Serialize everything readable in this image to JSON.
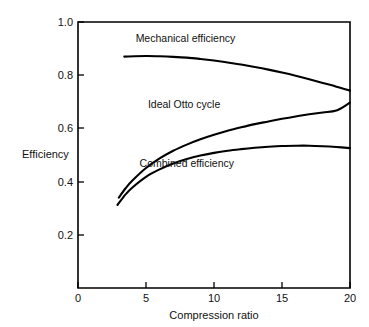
{
  "chart_data": {
    "type": "line",
    "title": "",
    "xlabel": "Compression ratio",
    "ylabel": "Efficiency",
    "xlim": [
      0,
      20
    ],
    "ylim": [
      0,
      1.0
    ],
    "grid": false,
    "legend_position": "inline-labels",
    "xticks": [
      0,
      5,
      10,
      15,
      20
    ],
    "xtick_labels": [
      "0",
      "5",
      "10",
      "15",
      "20"
    ],
    "yticks": [
      0.2,
      0.4,
      0.6,
      0.8,
      1.0
    ],
    "ytick_labels": [
      "0.2",
      "0.4",
      "0.6",
      "0.8",
      "1.0"
    ],
    "series": [
      {
        "name": "Mechanical efficiency",
        "color": "#000000",
        "x": [
          3.4,
          5,
          6,
          7,
          8,
          9,
          10,
          11,
          12,
          13,
          14,
          15,
          16,
          17,
          18,
          19,
          20
        ],
        "values": [
          0.87,
          0.872,
          0.871,
          0.869,
          0.866,
          0.861,
          0.855,
          0.848,
          0.84,
          0.831,
          0.821,
          0.81,
          0.798,
          0.785,
          0.771,
          0.757,
          0.742
        ]
      },
      {
        "name": "Ideal Otto cycle",
        "color": "#000000",
        "x": [
          3.0,
          3.5,
          4,
          5,
          6,
          7,
          8,
          9,
          10,
          11,
          12,
          13,
          14,
          15,
          16,
          17,
          18,
          19,
          20
        ],
        "values": [
          0.34,
          0.375,
          0.404,
          0.451,
          0.487,
          0.516,
          0.539,
          0.559,
          0.576,
          0.591,
          0.604,
          0.616,
          0.626,
          0.636,
          0.645,
          0.653,
          0.66,
          0.667,
          0.697
        ]
      },
      {
        "name": "Combined efficiency",
        "color": "#000000",
        "x": [
          2.9,
          3.5,
          4,
          5,
          6,
          7,
          8,
          9,
          10,
          11,
          12,
          13,
          14,
          15,
          16,
          17,
          18,
          19,
          20
        ],
        "values": [
          0.312,
          0.352,
          0.378,
          0.418,
          0.446,
          0.468,
          0.485,
          0.498,
          0.508,
          0.516,
          0.522,
          0.527,
          0.531,
          0.534,
          0.535,
          0.535,
          0.533,
          0.53,
          0.526
        ]
      }
    ],
    "annotations": [
      {
        "text": "Mechanical efficiency",
        "x": 7.9,
        "y": 0.925
      },
      {
        "text": "Ideal Otto cycle",
        "x": 7.8,
        "y": 0.675
      },
      {
        "text": "Combined efficiency",
        "x": 8.0,
        "y": 0.455
      }
    ]
  }
}
